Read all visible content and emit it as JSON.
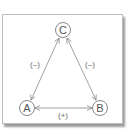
{
  "diagram": {
    "type": "triangle-relationship",
    "nodes": [
      {
        "id": "C",
        "label": "C",
        "cx": 63,
        "cy": 30
      },
      {
        "id": "A",
        "label": "A",
        "cx": 27,
        "cy": 108
      },
      {
        "id": "B",
        "label": "B",
        "cx": 100,
        "cy": 108
      }
    ],
    "edges": [
      {
        "from": "C",
        "to": "A",
        "label": "(–)",
        "sign": "negative"
      },
      {
        "from": "C",
        "to": "B",
        "label": "(–)",
        "sign": "negative"
      },
      {
        "from": "A",
        "to": "B",
        "label": "(+)",
        "sign": "positive"
      }
    ],
    "colors": {
      "line": "#8a8a8a",
      "node_stroke": "#7a7a7a",
      "text": "#555555",
      "frame_border": "#bdbdbd",
      "shadow": "#9a9a9a"
    }
  }
}
